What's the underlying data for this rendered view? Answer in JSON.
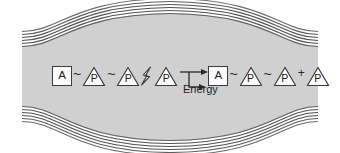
{
  "figure": {
    "colors": {
      "membrane_fill": "#d0d0d0",
      "membrane_line": "#6d6d6d",
      "membrane_line_dark": "#4a4a4a",
      "page_background": "#ffffff",
      "symbol_stroke": "#3a3a3a",
      "symbol_fill": "#fbfbfb",
      "text": "#1d1d1d"
    },
    "membrane": {
      "name": "lipid-bilayer-band",
      "line_count": 6,
      "shape": "wavy horizontal band, narrow at left and right edges, bulging at center"
    }
  },
  "equation": {
    "reactant": {
      "adenosine": {
        "label": "A",
        "shape": "square"
      },
      "bond1": "~",
      "phosphate1": {
        "label": "P",
        "shape": "triangle"
      },
      "bond2": "~",
      "phosphate2": {
        "label": "P",
        "shape": "triangle"
      },
      "lightning": "lightning-bolt",
      "phosphate3": {
        "label": "P",
        "shape": "triangle"
      }
    },
    "arrow": "→",
    "product": {
      "adenosine": {
        "label": "A",
        "shape": "square"
      },
      "bond1": "~",
      "phosphate1": {
        "label": "P",
        "shape": "triangle"
      },
      "bond2": "~",
      "phosphate2": {
        "label": "P",
        "shape": "triangle"
      },
      "plus": "+",
      "phosphate_free": {
        "label": "P",
        "shape": "triangle"
      }
    },
    "byproduct_label": "Energy"
  }
}
